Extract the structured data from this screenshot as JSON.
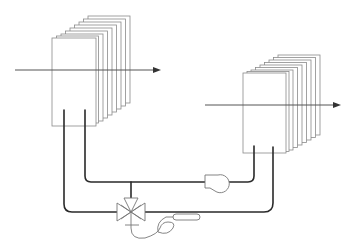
{
  "diagram": {
    "title": "",
    "colors": {
      "background": "#ffffff",
      "plate_stroke": "#8a8a8a",
      "pipe": "#2a2a2a",
      "symbol_stroke": "#777777"
    },
    "components": [
      {
        "id": "heat-exchanger-left",
        "type": "finned coil",
        "plates": 9
      },
      {
        "id": "heat-exchanger-right",
        "type": "finned coil",
        "plates": 9
      },
      {
        "id": "airflow-arrow-left",
        "type": "arrow",
        "direction": "right"
      },
      {
        "id": "airflow-arrow-right",
        "type": "arrow",
        "direction": "right"
      },
      {
        "id": "circulating-pump",
        "type": "pump"
      },
      {
        "id": "three-way-valve",
        "type": "3-way mixing valve"
      },
      {
        "id": "temperature-sensor",
        "type": "capillary bulb sensor"
      }
    ],
    "labels": []
  }
}
